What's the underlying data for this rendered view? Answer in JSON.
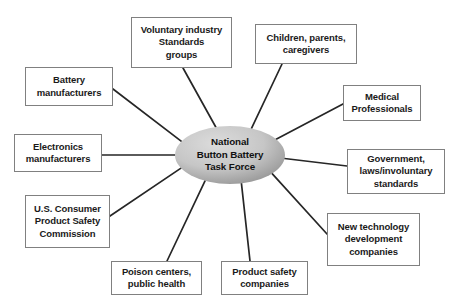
{
  "diagram": {
    "type": "hub-and-spoke",
    "colors": {
      "background": "#ffffff",
      "box_border": "#808080",
      "box_fill": "#ffffff",
      "text": "#1a1a1a",
      "hub_fill_light": "#d9d9d9",
      "hub_fill_dark": "#9a9a9a",
      "connector": "#262626"
    },
    "hub": {
      "label": "National\nButton Battery\nTask Force",
      "cx": 230,
      "cy": 155,
      "rx": 55,
      "ry": 29
    },
    "nodes": [
      {
        "id": "voluntary-industry-standards-groups",
        "label": "Voluntary industry\nStandards\ngroups",
        "x": 131,
        "y": 17,
        "w": 101,
        "h": 51,
        "anchor_x": 183,
        "anchor_y": 68,
        "hub_angle_deg": 255
      },
      {
        "id": "children-parents-caregivers",
        "label": "Children, parents,\ncaregivers",
        "x": 255,
        "y": 24,
        "w": 102,
        "h": 40,
        "anchor_x": 282,
        "anchor_y": 64,
        "hub_angle_deg": 293
      },
      {
        "id": "battery-manufacturers",
        "label": "Battery\nmanufacturers",
        "x": 25,
        "y": 67,
        "w": 88,
        "h": 39,
        "anchor_x": 113,
        "anchor_y": 89,
        "hub_angle_deg": 208
      },
      {
        "id": "medical-professionals",
        "label": "Medical\nProfessionals",
        "x": 343,
        "y": 85,
        "w": 78,
        "h": 36,
        "anchor_x": 343,
        "anchor_y": 104,
        "hub_angle_deg": 327
      },
      {
        "id": "electronics-manufacturers",
        "label": "Electronics\nmanufacturers",
        "x": 14,
        "y": 134,
        "w": 88,
        "h": 38,
        "anchor_x": 102,
        "anchor_y": 155,
        "hub_angle_deg": 180
      },
      {
        "id": "government-laws-involuntary-standards",
        "label": "Government,\nlaws/involuntary\nstandards",
        "x": 347,
        "y": 149,
        "w": 98,
        "h": 45,
        "anchor_x": 347,
        "anchor_y": 166,
        "hub_angle_deg": 7
      },
      {
        "id": "us-consumer-product-safety-commission",
        "label": "U.S. Consumer\nProduct Safety\nCommission",
        "x": 25,
        "y": 195,
        "w": 85,
        "h": 53,
        "anchor_x": 110,
        "anchor_y": 216,
        "hub_angle_deg": 153
      },
      {
        "id": "new-technology-development-companies",
        "label": "New technology\ndevelopment\ncompanies",
        "x": 327,
        "y": 213,
        "w": 93,
        "h": 53,
        "anchor_x": 327,
        "anchor_y": 234,
        "hub_angle_deg": 40
      },
      {
        "id": "poison-centers-public-health",
        "label": "Poison centers,\npublic health",
        "x": 111,
        "y": 261,
        "w": 91,
        "h": 34,
        "anchor_x": 167,
        "anchor_y": 261,
        "hub_angle_deg": 117
      },
      {
        "id": "product-safety-companies",
        "label": "Product safety\ncompanies",
        "x": 221,
        "y": 261,
        "w": 87,
        "h": 34,
        "anchor_x": 250,
        "anchor_y": 261,
        "hub_angle_deg": 78
      }
    ]
  }
}
